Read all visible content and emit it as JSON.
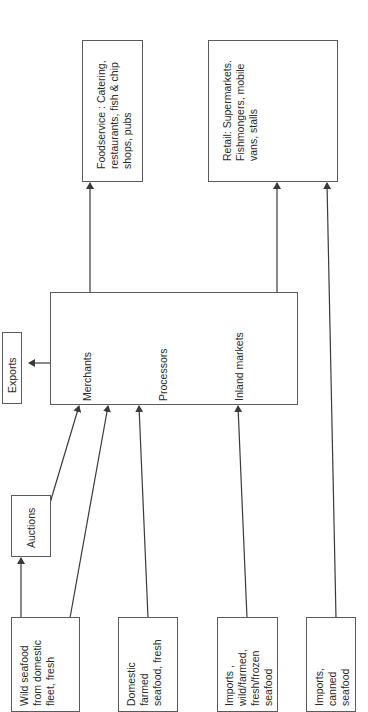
{
  "diagram": {
    "orientation": "rotated-90-ccw",
    "sources": [
      {
        "id": "wild",
        "lines": [
          "Wild seafood",
          "from domestic",
          "fleet, fresh"
        ]
      },
      {
        "id": "domestic_farmed",
        "lines": [
          "Domestic",
          "farmed",
          "seafood, fresh"
        ]
      },
      {
        "id": "imports_fresh",
        "lines": [
          "Imports ,",
          "wild/farmed,",
          "fresh/frozen",
          "seafood"
        ]
      },
      {
        "id": "imports_canned",
        "lines": [
          "Imports,",
          "canned",
          "seafood"
        ]
      }
    ],
    "auctions": {
      "label": "Auctions"
    },
    "exports": {
      "label": "Exports"
    },
    "hub": {
      "merchants": "Merchants",
      "processors": "Processors",
      "inland_markets": "Inland markets"
    },
    "outlets": {
      "foodservice": {
        "lines": [
          "Foodservice : Catering,",
          "restaurants, fish & chip",
          "shops, pubs"
        ]
      },
      "retail": {
        "lines": [
          "Retail: Supermarkets.",
          "Fishmongers, mobile",
          "vans, stalls"
        ]
      }
    },
    "flows": [
      {
        "from": "wild",
        "to": "auctions"
      },
      {
        "from": "auctions",
        "to": "merchants"
      },
      {
        "from": "wild",
        "to": "merchants"
      },
      {
        "from": "domestic_farmed",
        "to": "processors"
      },
      {
        "from": "imports_fresh",
        "to": "inland_markets"
      },
      {
        "from": "imports_canned",
        "to": "retail"
      },
      {
        "from": "hub",
        "to": "exports"
      },
      {
        "from": "hub",
        "to": "foodservice"
      },
      {
        "from": "hub",
        "to": "retail"
      }
    ],
    "colors": {
      "line": "#3a3a3a",
      "border": "#5a5a5a",
      "text": "#2a2a2a"
    }
  }
}
